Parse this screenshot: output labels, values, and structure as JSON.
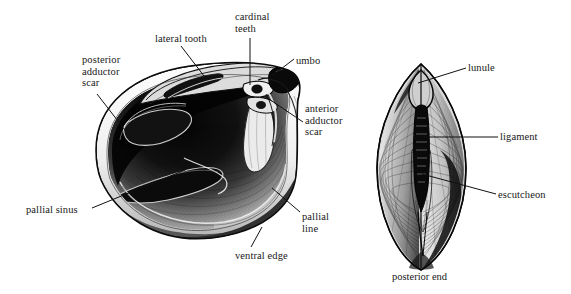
{
  "figure": {
    "title_hidden": "",
    "background_color": "#ffffff",
    "ink_color": "#111111",
    "left_view": {
      "name": "interior-valve-view",
      "labels": [
        {
          "id": "posterior-adductor-scar",
          "text": "posterior\nadductor\nscar",
          "x": 82,
          "y": 54,
          "align": "left"
        },
        {
          "id": "lateral-tooth",
          "text": "lateral tooth",
          "x": 155,
          "y": 33,
          "align": "left"
        },
        {
          "id": "cardinal-teeth",
          "text": "cardinal\nteeth",
          "x": 235,
          "y": 11,
          "align": "left"
        },
        {
          "id": "umbo",
          "text": "umbo",
          "x": 296,
          "y": 55,
          "align": "left"
        },
        {
          "id": "anterior-adductor-scar",
          "text": "anterior\nadductor\nscar",
          "x": 305,
          "y": 103,
          "align": "left"
        },
        {
          "id": "pallial-line",
          "text": "pallial\nline",
          "x": 302,
          "y": 211,
          "align": "left"
        },
        {
          "id": "ventral-edge",
          "text": "ventral edge",
          "x": 235,
          "y": 250,
          "align": "left"
        },
        {
          "id": "pallial-sinus",
          "text": "pallial sinus",
          "x": 26,
          "y": 204,
          "align": "left"
        }
      ],
      "leaders": [
        {
          "id": "leader-posterior-adductor-scar",
          "x1": 97,
          "y1": 94,
          "x2": 128,
          "y2": 134
        },
        {
          "id": "leader-lateral-tooth",
          "x1": 181,
          "y1": 46,
          "x2": 204,
          "y2": 76
        },
        {
          "id": "leader-cardinal-teeth",
          "x1": 250,
          "y1": 38,
          "x2": 250,
          "y2": 85
        },
        {
          "id": "leader-umbo",
          "x1": 294,
          "y1": 59,
          "x2": 268,
          "y2": 79
        },
        {
          "id": "leader-anterior-adductor-scar",
          "x1": 303,
          "y1": 122,
          "x2": 266,
          "y2": 97
        },
        {
          "id": "leader-pallial-line",
          "x1": 300,
          "y1": 212,
          "x2": 272,
          "y2": 188
        },
        {
          "id": "leader-ventral-edge",
          "x1": 251,
          "y1": 247,
          "x2": 262,
          "y2": 227
        },
        {
          "id": "leader-pallial-sinus",
          "x1": 92,
          "y1": 208,
          "x2": 185,
          "y2": 170
        }
      ]
    },
    "right_view": {
      "name": "dorsal-view",
      "caption": {
        "id": "posterior-end",
        "text": "posterior end",
        "x": 392,
        "y": 271
      },
      "labels": [
        {
          "id": "lunule",
          "text": "lunule",
          "x": 468,
          "y": 62,
          "align": "left"
        },
        {
          "id": "ligament",
          "text": "ligament",
          "x": 500,
          "y": 131,
          "align": "left"
        },
        {
          "id": "escutcheon",
          "text": "escutcheon",
          "x": 498,
          "y": 189,
          "align": "left"
        }
      ],
      "leaders": [
        {
          "id": "leader-lunule",
          "x1": 466,
          "y1": 68,
          "x2": 418,
          "y2": 83
        },
        {
          "id": "leader-ligament",
          "x1": 498,
          "y1": 137,
          "x2": 424,
          "y2": 137
        },
        {
          "id": "leader-escutcheon",
          "x1": 496,
          "y1": 194,
          "x2": 422,
          "y2": 174
        }
      ]
    }
  }
}
